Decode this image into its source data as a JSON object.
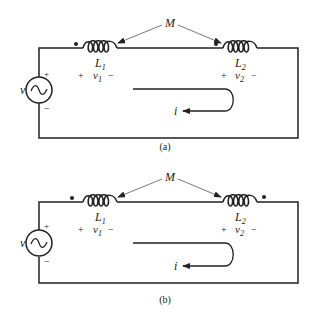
{
  "panels": [
    {
      "label": "(a)",
      "mutual": "M",
      "source": {
        "symbol": "v",
        "plus": "+",
        "minus": "−"
      },
      "inductor1": {
        "name": "L",
        "sub": "1",
        "dot": "left"
      },
      "inductor2": {
        "name": "L",
        "sub": "2",
        "dot": "left"
      },
      "v1": {
        "plus": "+",
        "name": "v",
        "sub": "1",
        "minus": "−"
      },
      "v2": {
        "plus": "+",
        "name": "v",
        "sub": "2",
        "minus": "−"
      },
      "current": "i"
    },
    {
      "label": "(b)",
      "mutual": "M",
      "source": {
        "symbol": "v",
        "plus": "+",
        "minus": "−"
      },
      "inductor1": {
        "name": "L",
        "sub": "1",
        "dot": "left"
      },
      "inductor2": {
        "name": "L",
        "sub": "2",
        "dot": "right"
      },
      "v1": {
        "plus": "+",
        "name": "v",
        "sub": "1",
        "minus": "−"
      },
      "v2": {
        "plus": "+",
        "name": "v",
        "sub": "2",
        "minus": "−"
      },
      "current": "i"
    }
  ]
}
